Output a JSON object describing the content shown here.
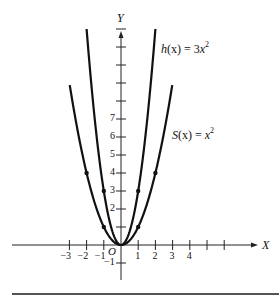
{
  "chart_data": {
    "type": "line",
    "title": "",
    "xlabel": "X",
    "ylabel": "Y",
    "origin_label": "O",
    "x_ticks": [
      -3,
      -2,
      -1,
      1,
      2,
      3,
      4,
      5,
      6
    ],
    "x_tick_labels": [
      "-3",
      "-2",
      "-1",
      "1",
      "2",
      "3",
      "4"
    ],
    "y_ticks": [
      -1,
      1,
      2,
      3,
      4,
      5,
      6,
      7,
      8,
      9,
      10,
      11,
      12
    ],
    "y_tick_labels": [
      "-1",
      "2",
      "3",
      "4",
      "5",
      "6",
      "7"
    ],
    "xlim": [
      -6.4,
      8
    ],
    "ylim": [
      -2,
      12.5
    ],
    "grid": false,
    "series": [
      {
        "name": "S(x) = x^2",
        "label_fn": "S",
        "label_exp": "x",
        "label_power": "2",
        "coefficient": 1,
        "domain": [
          -2.98,
          2.98
        ],
        "marked_points": [
          [
            -2,
            4
          ],
          [
            -1,
            1
          ],
          [
            0,
            0
          ],
          [
            1,
            1
          ],
          [
            2,
            4
          ]
        ]
      },
      {
        "name": "h(x) = 3x^2",
        "label_fn": "h",
        "label_exp": "3x",
        "label_power": "2",
        "coefficient": 3,
        "domain": [
          -2,
          2
        ],
        "marked_points": [
          [
            -1,
            3
          ],
          [
            0,
            0
          ],
          [
            1,
            3
          ]
        ]
      }
    ],
    "annotations": [
      {
        "text": "h(x) = 3x²",
        "near": "h curve, upper right"
      },
      {
        "text": "S(x) = x²",
        "near": "S curve, right"
      }
    ]
  },
  "labels": {
    "x_axis": "X",
    "y_axis": "Y",
    "origin": "O",
    "h_fn": "h",
    "h_arg": "(x) = 3",
    "h_var": "x",
    "h_pow": "2",
    "s_fn": "S",
    "s_arg": "(x) = ",
    "s_var": "x",
    "s_pow": "2"
  }
}
